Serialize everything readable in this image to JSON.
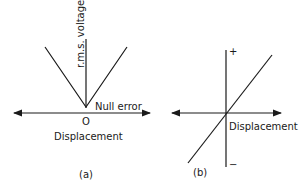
{
  "figure_a": {
    "caption": "(a)",
    "y_axis_label": "r.m.s. voltage",
    "x_axis_label": "Displacement",
    "origin_label": "O",
    "annotation": "Null error",
    "curve_shape": "V (absolute value)"
  },
  "figure_b": {
    "caption": "(b)",
    "x_axis_label": "Displacement",
    "y_positive_label": "+",
    "y_negative_label": "−",
    "curve_shape": "linear through origin"
  },
  "colors": {
    "line": "#1a1a1a",
    "background": "#ffffff"
  }
}
